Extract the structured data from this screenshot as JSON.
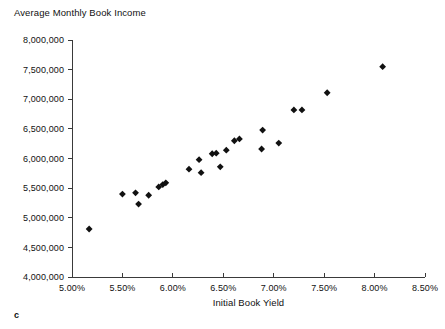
{
  "chart_data": {
    "type": "scatter",
    "title": "Average Monthly Book Income",
    "xlabel": "Initial Book Yield",
    "ylabel": "Average Monthly Book Income",
    "xlim": [
      5.0,
      8.5
    ],
    "ylim": [
      4000000,
      8000000
    ],
    "grid": false,
    "legend": null,
    "x_tick_labels": [
      "5.00%",
      "5.50%",
      "6.00%",
      "6.50%",
      "7.00%",
      "7.50%",
      "8.00%",
      "8.50%"
    ],
    "x_tick_values": [
      5.0,
      5.5,
      6.0,
      6.5,
      7.0,
      7.5,
      8.0,
      8.5
    ],
    "y_tick_labels": [
      "4,000,000",
      "4,500,000",
      "5,000,000",
      "5,500,000",
      "6,000,000",
      "6,500,000",
      "7,000,000",
      "7,500,000",
      "8,000,000"
    ],
    "y_tick_values": [
      4000000,
      4500000,
      5000000,
      5500000,
      6000000,
      6500000,
      7000000,
      7500000,
      8000000
    ],
    "marker": "diamond",
    "marker_color": "#111111",
    "points": [
      {
        "x": 5.17,
        "y": 4810000
      },
      {
        "x": 5.5,
        "y": 5400000
      },
      {
        "x": 5.63,
        "y": 5420000
      },
      {
        "x": 5.66,
        "y": 5230000
      },
      {
        "x": 5.76,
        "y": 5380000
      },
      {
        "x": 5.86,
        "y": 5520000
      },
      {
        "x": 5.9,
        "y": 5560000
      },
      {
        "x": 5.93,
        "y": 5590000
      },
      {
        "x": 6.16,
        "y": 5820000
      },
      {
        "x": 6.26,
        "y": 5980000
      },
      {
        "x": 6.28,
        "y": 5760000
      },
      {
        "x": 6.39,
        "y": 6080000
      },
      {
        "x": 6.43,
        "y": 6090000
      },
      {
        "x": 6.47,
        "y": 5860000
      },
      {
        "x": 6.53,
        "y": 6140000
      },
      {
        "x": 6.61,
        "y": 6300000
      },
      {
        "x": 6.66,
        "y": 6330000
      },
      {
        "x": 6.88,
        "y": 6160000
      },
      {
        "x": 6.89,
        "y": 6480000
      },
      {
        "x": 7.05,
        "y": 6260000
      },
      {
        "x": 7.2,
        "y": 6820000
      },
      {
        "x": 7.28,
        "y": 6820000
      },
      {
        "x": 7.53,
        "y": 7110000
      },
      {
        "x": 8.08,
        "y": 7550000
      }
    ]
  },
  "annotations": {
    "corner_note": "c"
  }
}
